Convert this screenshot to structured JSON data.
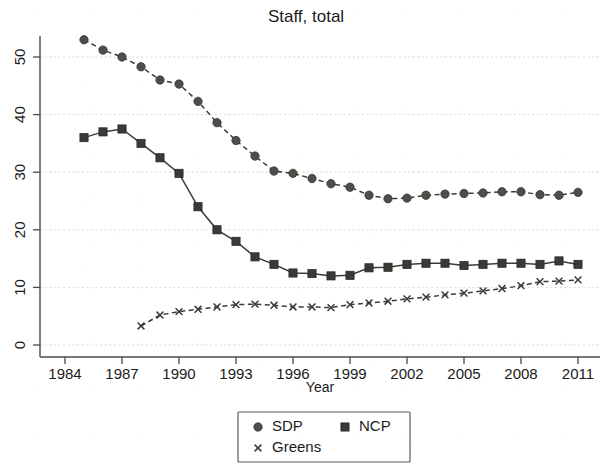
{
  "chart_data": {
    "type": "line",
    "title": "Staff, total",
    "xlabel": "Year",
    "ylabel": "",
    "xlim": [
      1984,
      2012
    ],
    "ylim": [
      0,
      55
    ],
    "xticks": [
      1984,
      1987,
      1990,
      1993,
      1996,
      1999,
      2002,
      2005,
      2008,
      2011
    ],
    "yticks": [
      0,
      10,
      20,
      30,
      40,
      50
    ],
    "grid": true,
    "legend_position": "bottom-center",
    "series": [
      {
        "name": "SDP",
        "marker": "circle",
        "linestyle": "dashed",
        "x": [
          1985,
          1986,
          1987,
          1988,
          1989,
          1990,
          1991,
          1992,
          1993,
          1994,
          1995,
          1996,
          1997,
          1998,
          1999,
          2000,
          2001,
          2002,
          2003,
          2004,
          2005,
          2006,
          2007,
          2008,
          2009,
          2010,
          2011
        ],
        "values": [
          53,
          51.2,
          50,
          48.3,
          46,
          45.3,
          42.3,
          38.6,
          35.5,
          32.8,
          30.2,
          29.8,
          28.9,
          28,
          27.4,
          26,
          25.4,
          25.5,
          26,
          26.2,
          26.3,
          26.4,
          26.6,
          26.6,
          26.1,
          26,
          26.5
        ]
      },
      {
        "name": "NCP",
        "marker": "square",
        "linestyle": "solid",
        "x": [
          1985,
          1986,
          1987,
          1988,
          1989,
          1990,
          1991,
          1992,
          1993,
          1994,
          1995,
          1996,
          1997,
          1998,
          1999,
          2000,
          2001,
          2002,
          2003,
          2004,
          2005,
          2006,
          2007,
          2008,
          2009,
          2010,
          2011
        ],
        "values": [
          36,
          37,
          37.5,
          35,
          32.5,
          29.8,
          24,
          20,
          18,
          15.3,
          14,
          12.5,
          12.4,
          12,
          12.1,
          13.4,
          13.5,
          14,
          14.2,
          14.2,
          13.8,
          14,
          14.2,
          14.2,
          14,
          14.6,
          14
        ]
      },
      {
        "name": "Greens",
        "marker": "cross",
        "linestyle": "dashed",
        "x": [
          1988,
          1989,
          1990,
          1991,
          1992,
          1993,
          1994,
          1995,
          1996,
          1997,
          1998,
          1999,
          2000,
          2001,
          2002,
          2003,
          2004,
          2005,
          2006,
          2007,
          2008,
          2009,
          2010,
          2011
        ],
        "values": [
          3.3,
          5.2,
          5.8,
          6.2,
          6.6,
          7,
          7.1,
          6.9,
          6.6,
          6.6,
          6.5,
          7,
          7.3,
          7.6,
          8,
          8.3,
          8.7,
          9,
          9.4,
          9.8,
          10.3,
          11,
          11.1,
          11.3
        ]
      }
    ]
  },
  "legend": {
    "entries": [
      {
        "label": "SDP",
        "marker": "circle"
      },
      {
        "label": "NCP",
        "marker": "square"
      },
      {
        "label": "Greens",
        "marker": "cross"
      }
    ]
  },
  "colors": {
    "marker_circle": "#4f4f4a",
    "marker_square": "#3a3a36",
    "line": "#3b3b38",
    "grid": "#c9c9c4",
    "axis": "#4a4a4a",
    "text": "#1b1b1b",
    "background": "#ffffff"
  }
}
